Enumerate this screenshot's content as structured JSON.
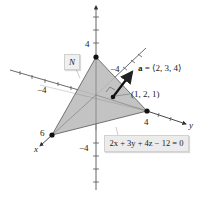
{
  "diagram": {
    "plane_label": "N",
    "equation_label": "2x + 3y + 4z − 12 = 0",
    "vector_label": "a = ⟨2, 3, 4⟩",
    "vector_bold_part": "a",
    "vector_rest": " = ⟨2, 3, 4⟩",
    "point_label": "(1, 2, 1)",
    "axes": {
      "x": {
        "name": "x",
        "tick_label_pos": "6",
        "tick_label_neg": "−4"
      },
      "y": {
        "name": "y",
        "tick_label_pos": "4",
        "tick_label_neg": "−4"
      },
      "z": {
        "tick_label_pos": "4",
        "tick_label_neg": "−4"
      }
    },
    "intercepts": [
      {
        "axis": "x",
        "value": 6
      },
      {
        "axis": "y",
        "value": 4
      },
      {
        "axis": "z",
        "value": 3
      }
    ],
    "colors": {
      "plane_fill": "#bdbdbd",
      "plane_edge": "#555555",
      "axis": "#444444",
      "point": "#111111",
      "label_box": "#ececec"
    }
  }
}
